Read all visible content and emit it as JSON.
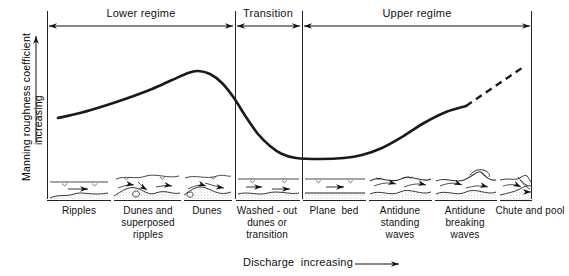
{
  "figure": {
    "axis_y_label_line1": "Manning roughness coefficient",
    "axis_y_label_line2": "increasing",
    "axis_x_label": "Discharge  increasing",
    "y_arrow_icon": "up-arrow-icon",
    "x_arrow_icon": "right-arrow-icon"
  },
  "regimes": [
    {
      "label": "Lower regime",
      "x_start": 47,
      "x_end": 235
    },
    {
      "label": "Transition",
      "x_start": 235,
      "x_end": 302
    },
    {
      "label": "Upper regime",
      "x_start": 302,
      "x_end": 532
    }
  ],
  "bedforms": [
    {
      "label": "Ripples",
      "center": 79,
      "panel_x0": 47,
      "panel_x1": 111,
      "sketch": "ripples-sketch"
    },
    {
      "label": "Dunes and\nsuperposed\nripples",
      "center": 148,
      "panel_x0": 114,
      "panel_x1": 181,
      "sketch": "dunes-superposed-ripples-sketch"
    },
    {
      "label": "Dunes",
      "center": 207,
      "panel_x0": 184,
      "panel_x1": 232,
      "sketch": "dunes-sketch"
    },
    {
      "label": "Washed - out\ndunes or\ntransition",
      "center": 267,
      "panel_x0": 236,
      "panel_x1": 300,
      "sketch": "washed-out-dunes-sketch"
    },
    {
      "label": "Plane  bed",
      "center": 334,
      "panel_x0": 303,
      "panel_x1": 366,
      "sketch": "plane-bed-sketch"
    },
    {
      "label": "Antidune\nstanding\nwaves",
      "center": 400,
      "panel_x0": 369,
      "panel_x1": 432,
      "sketch": "antidune-standing-waves-sketch"
    },
    {
      "label": "Antidune\nbreaking\nwaves",
      "center": 465,
      "panel_x0": 435,
      "panel_x1": 497,
      "sketch": "antidune-breaking-waves-sketch"
    },
    {
      "label": "Chute and pool",
      "center": 530,
      "panel_x0": 500,
      "panel_x1": 532,
      "sketch": "chute-and-pool-sketch"
    }
  ],
  "chart_data": {
    "type": "line",
    "title": "",
    "xlabel": "Discharge  increasing",
    "ylabel": "Manning roughness coefficient increasing",
    "grid": false,
    "legend": "none",
    "axis_note": "Qualitative axes, no numeric tick labels",
    "series": [
      {
        "name": "Manning roughness coefficient (solid)",
        "style": "solid",
        "points": [
          [
            58,
            118
          ],
          [
            80,
            113
          ],
          [
            104,
            106
          ],
          [
            128,
            98
          ],
          [
            152,
            89
          ],
          [
            172,
            80
          ],
          [
            188,
            73
          ],
          [
            198,
            71
          ],
          [
            210,
            74
          ],
          [
            222,
            83
          ],
          [
            234,
            98
          ],
          [
            246,
            117
          ],
          [
            258,
            134
          ],
          [
            270,
            146
          ],
          [
            282,
            154
          ],
          [
            296,
            158
          ],
          [
            320,
            159
          ],
          [
            344,
            158
          ],
          [
            362,
            155
          ],
          [
            382,
            148
          ],
          [
            402,
            137
          ],
          [
            424,
            123
          ],
          [
            446,
            112
          ],
          [
            466,
            106
          ]
        ]
      },
      {
        "name": "Extrapolated trend (dashed)",
        "style": "dashed",
        "points": [
          [
            466,
            106
          ],
          [
            522,
            68
          ]
        ]
      }
    ],
    "annotations": {
      "peak_region": "Dunes",
      "minimum_region": "Plane bed",
      "rise_region": "Antidune / Chute and pool"
    }
  },
  "colors": {
    "ink": "#111111",
    "curve": "#1a1a1a",
    "rule": "#222222",
    "bed_fill": "#b8b8b8"
  }
}
